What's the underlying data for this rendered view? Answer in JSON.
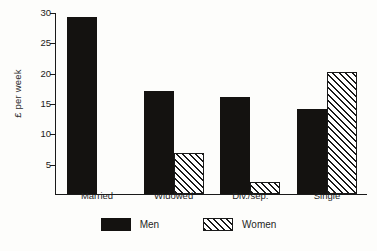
{
  "chart_data": {
    "type": "bar",
    "title": "",
    "subtitle": "",
    "xlabel": "",
    "ylabel": "£ per week",
    "categories": [
      "Married",
      "Widowed",
      "Div./sep.",
      "Single"
    ],
    "series": [
      {
        "name": "Men",
        "values": [
          29.2,
          17.0,
          16.0,
          14.0
        ]
      },
      {
        "name": "Women",
        "values": [
          0,
          6.8,
          2.0,
          20.1
        ]
      }
    ],
    "ylim": [
      0,
      30
    ],
    "yticks": [
      5,
      10,
      15,
      20,
      25,
      30
    ],
    "ytick_labels": [
      "5",
      "10",
      "15",
      "20",
      "25",
      "30"
    ],
    "grid": false,
    "legend_position": "bottom-center",
    "legend_entries": [
      "Men",
      "Women"
    ],
    "annotations": []
  },
  "axis": {
    "y_label": "£ per week",
    "ticks": [
      {
        "value": 30,
        "label": "30"
      },
      {
        "value": 25,
        "label": "25"
      },
      {
        "value": 20,
        "label": "20"
      },
      {
        "value": 15,
        "label": "15"
      },
      {
        "value": 10,
        "label": "10"
      },
      {
        "value": 5,
        "label": "5"
      }
    ]
  },
  "categories": [
    {
      "label": "Married"
    },
    {
      "label": "Widowed"
    },
    {
      "label": "Div./sep."
    },
    {
      "label": "Single"
    }
  ],
  "legend": {
    "items": [
      {
        "label": "Men",
        "swatch": "solid-black-swatch"
      },
      {
        "label": "Women",
        "swatch": "hatched-swatch"
      }
    ]
  },
  "colors": {
    "men": "#141210",
    "women_line": "#1a1a1a",
    "women_fill": "#ffffff",
    "axis": "#1a1a1a",
    "background": "#fdfdfb"
  }
}
